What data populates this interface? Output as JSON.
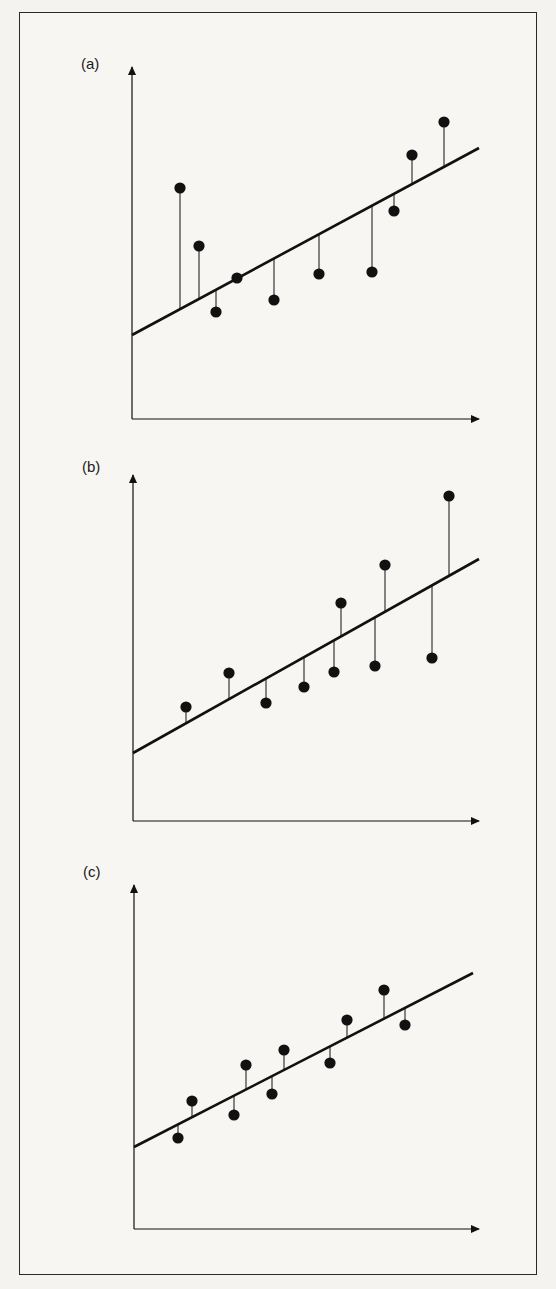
{
  "figure": {
    "panels": [
      {
        "label": "(a)"
      },
      {
        "label": "(b)"
      },
      {
        "label": "(c)"
      }
    ]
  },
  "colors": {
    "ink": "#111111",
    "paper": "#f7f6f2"
  },
  "chart_data": [
    {
      "type": "scatter",
      "title": "(a)",
      "xlabel": "",
      "ylabel": "",
      "note": "Regression line with vertical residuals; large residuals, poor fit",
      "grid": false,
      "axes_px": {
        "origin": [
          132,
          419
        ],
        "y_top": 67,
        "x_right": 479
      },
      "fit_line_px": [
        [
          132,
          335
        ],
        [
          479,
          148
        ]
      ],
      "points_px": [
        [
          180,
          188
        ],
        [
          199,
          246
        ],
        [
          216,
          312
        ],
        [
          237,
          278
        ],
        [
          274,
          300
        ],
        [
          319,
          274
        ],
        [
          372,
          272
        ],
        [
          394,
          211
        ],
        [
          412,
          155
        ],
        [
          444,
          122
        ]
      ],
      "x": [
        0.14,
        0.19,
        0.24,
        0.3,
        0.41,
        0.54,
        0.69,
        0.75,
        0.81,
        0.9
      ],
      "y": [
        0.66,
        0.49,
        0.3,
        0.4,
        0.34,
        0.41,
        0.42,
        0.59,
        0.75,
        0.84
      ],
      "fit": {
        "intercept": 0.24,
        "slope": 0.54
      },
      "xlim": [
        0,
        1
      ],
      "ylim": [
        0,
        1
      ]
    },
    {
      "type": "scatter",
      "title": "(b)",
      "xlabel": "",
      "ylabel": "",
      "note": "Regression line with vertical residuals; residuals grow with x (heteroscedastic)",
      "grid": false,
      "axes_px": {
        "origin": [
          133,
          821
        ],
        "y_top": 475,
        "x_right": 479
      },
      "fit_line_px": [
        [
          133,
          753
        ],
        [
          479,
          559
        ]
      ],
      "points_px": [
        [
          186,
          707
        ],
        [
          229,
          673
        ],
        [
          266,
          703
        ],
        [
          304,
          687
        ],
        [
          334,
          672
        ],
        [
          341,
          603
        ],
        [
          375,
          666
        ],
        [
          385,
          565
        ],
        [
          432,
          658
        ],
        [
          449,
          496
        ]
      ],
      "x": [
        0.15,
        0.28,
        0.38,
        0.49,
        0.58,
        0.6,
        0.7,
        0.73,
        0.86,
        0.91
      ],
      "y": [
        0.33,
        0.43,
        0.34,
        0.39,
        0.43,
        0.63,
        0.45,
        0.74,
        0.47,
        0.94
      ],
      "fit": {
        "intercept": 0.2,
        "slope": 0.56
      },
      "xlim": [
        0,
        1
      ],
      "ylim": [
        0,
        1
      ]
    },
    {
      "type": "scatter",
      "title": "(c)",
      "xlabel": "",
      "ylabel": "",
      "note": "Regression line with vertical residuals; small residuals, good fit",
      "grid": false,
      "axes_px": {
        "origin": [
          134,
          1229
        ],
        "y_top": 885,
        "x_right": 479
      },
      "fit_line_px": [
        [
          134,
          1147
        ],
        [
          473,
          973
        ]
      ],
      "points_px": [
        [
          178,
          1138
        ],
        [
          192,
          1101
        ],
        [
          234,
          1115
        ],
        [
          246,
          1065
        ],
        [
          272,
          1094
        ],
        [
          284,
          1050
        ],
        [
          330,
          1063
        ],
        [
          347,
          1020
        ],
        [
          384,
          990
        ],
        [
          405,
          1025
        ]
      ],
      "x": [
        0.13,
        0.17,
        0.29,
        0.32,
        0.4,
        0.43,
        0.57,
        0.62,
        0.72,
        0.79
      ],
      "y": [
        0.26,
        0.37,
        0.33,
        0.48,
        0.39,
        0.52,
        0.48,
        0.61,
        0.7,
        0.59
      ],
      "fit": {
        "intercept": 0.24,
        "slope": 0.51
      },
      "xlim": [
        0,
        1
      ],
      "ylim": [
        0,
        1
      ]
    }
  ]
}
